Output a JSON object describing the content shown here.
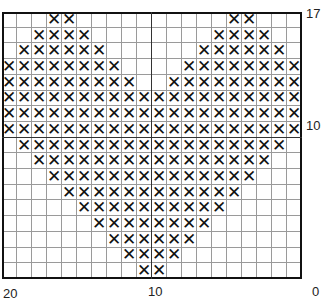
{
  "chart": {
    "columns": 20,
    "rows": 17,
    "symbol": "✕",
    "stitch_color": "#111111",
    "grid_color": "#9a9a9a",
    "filled_ranges_by_row_top_to_bottom": [
      [
        [
          3,
          4
        ],
        [
          15,
          16
        ]
      ],
      [
        [
          2,
          5
        ],
        [
          14,
          17
        ]
      ],
      [
        [
          1,
          6
        ],
        [
          13,
          18
        ]
      ],
      [
        [
          0,
          7
        ],
        [
          12,
          19
        ]
      ],
      [
        [
          0,
          8
        ],
        [
          11,
          19
        ]
      ],
      [
        [
          0,
          19
        ]
      ],
      [
        [
          0,
          19
        ]
      ],
      [
        [
          0,
          19
        ]
      ],
      [
        [
          1,
          18
        ]
      ],
      [
        [
          2,
          17
        ]
      ],
      [
        [
          3,
          16
        ]
      ],
      [
        [
          4,
          15
        ]
      ],
      [
        [
          5,
          14
        ]
      ],
      [
        [
          6,
          13
        ]
      ],
      [
        [
          7,
          12
        ]
      ],
      [
        [
          8,
          11
        ]
      ],
      [
        [
          9,
          10
        ]
      ]
    ],
    "major_line_after_column": 10,
    "major_line_after_row": 7
  },
  "labels": {
    "right_top": "17",
    "right_middle": "10",
    "right_bottom": "0",
    "bottom_left": "20",
    "bottom_middle": "10"
  }
}
